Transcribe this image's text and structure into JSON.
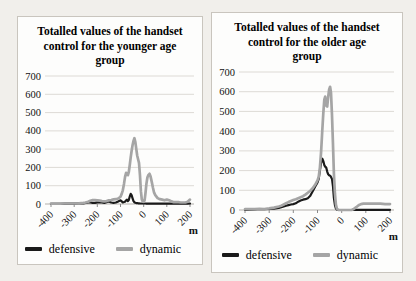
{
  "chart_data": [
    {
      "type": "line",
      "title": "Totalled values of the handset control for the younger age group",
      "xlabel": "m",
      "ylim": [
        0,
        700
      ],
      "yticks": [
        0,
        100,
        200,
        300,
        400,
        500,
        600,
        700
      ],
      "xticks": [
        -400,
        -300,
        -200,
        -100,
        0,
        100,
        200
      ],
      "grid": "horizontal",
      "legend_position": "bottom",
      "x": [
        -400,
        -380,
        -360,
        -340,
        -320,
        -300,
        -280,
        -260,
        -250,
        -240,
        -230,
        -220,
        -210,
        -200,
        -190,
        -180,
        -170,
        -160,
        -150,
        -140,
        -130,
        -120,
        -110,
        -100,
        -95,
        -90,
        -85,
        -80,
        -76,
        -72,
        -68,
        -64,
        -60,
        -56,
        -52,
        -48,
        -44,
        -40,
        -36,
        -32,
        -28,
        -24,
        -20,
        -16,
        -12,
        -8,
        -4,
        0,
        4,
        8,
        12,
        16,
        20,
        25,
        30,
        35,
        40,
        45,
        50,
        60,
        70,
        80,
        90,
        100,
        110,
        120,
        130,
        140,
        150,
        160,
        170,
        180,
        190,
        200
      ],
      "series": [
        {
          "name": "defensive",
          "color": "#1a1a1a",
          "values": [
            1,
            1,
            1,
            2,
            2,
            2,
            3,
            4,
            6,
            8,
            8,
            6,
            6,
            9,
            10,
            8,
            6,
            10,
            14,
            8,
            6,
            8,
            14,
            20,
            14,
            9,
            11,
            13,
            20,
            24,
            16,
            22,
            42,
            55,
            48,
            32,
            16,
            10,
            7,
            5,
            5,
            4,
            4,
            3,
            3,
            3,
            3,
            3,
            3,
            3,
            2,
            2,
            2,
            2,
            2,
            2,
            2,
            2,
            2,
            2,
            2,
            3,
            2,
            3,
            2,
            2,
            2,
            2,
            2,
            2,
            2,
            2,
            2,
            3
          ]
        },
        {
          "name": "dynamic",
          "color": "#a5a5a5",
          "values": [
            2,
            2,
            2,
            3,
            3,
            3,
            4,
            6,
            8,
            12,
            18,
            22,
            22,
            20,
            18,
            16,
            15,
            16,
            20,
            22,
            25,
            26,
            30,
            40,
            55,
            75,
            110,
            150,
            170,
            160,
            158,
            175,
            215,
            255,
            290,
            320,
            345,
            360,
            340,
            300,
            265,
            245,
            225,
            155,
            70,
            25,
            14,
            12,
            20,
            60,
            110,
            145,
            158,
            165,
            150,
            120,
            90,
            62,
            48,
            32,
            26,
            24,
            20,
            24,
            20,
            14,
            10,
            10,
            10,
            8,
            8,
            8,
            12,
            24
          ]
        }
      ]
    },
    {
      "type": "line",
      "title": "Totalled values of the handset control for the older age group",
      "xlabel": "m",
      "ylim": [
        0,
        700
      ],
      "yticks": [
        0,
        100,
        200,
        300,
        400,
        500,
        600,
        700
      ],
      "xticks": [
        -400,
        -300,
        -200,
        -100,
        0,
        100,
        200
      ],
      "grid": "horizontal",
      "legend_position": "bottom",
      "x": [
        -400,
        -380,
        -360,
        -340,
        -320,
        -300,
        -280,
        -260,
        -250,
        -240,
        -230,
        -220,
        -210,
        -200,
        -190,
        -180,
        -170,
        -160,
        -150,
        -140,
        -130,
        -120,
        -110,
        -100,
        -95,
        -90,
        -85,
        -80,
        -76,
        -72,
        -68,
        -64,
        -60,
        -56,
        -52,
        -48,
        -44,
        -40,
        -36,
        -32,
        -28,
        -24,
        -20,
        -16,
        -12,
        -8,
        -4,
        0,
        4,
        8,
        12,
        16,
        20,
        25,
        30,
        35,
        40,
        45,
        50,
        60,
        70,
        80,
        90,
        100,
        110,
        120,
        130,
        140,
        150,
        160,
        170,
        180,
        190,
        200
      ],
      "series": [
        {
          "name": "defensive",
          "color": "#1a1a1a",
          "values": [
            1,
            2,
            3,
            5,
            4,
            5,
            7,
            10,
            14,
            18,
            22,
            25,
            28,
            30,
            34,
            42,
            48,
            52,
            55,
            60,
            72,
            95,
            118,
            140,
            158,
            200,
            240,
            260,
            248,
            228,
            220,
            215,
            195,
            182,
            176,
            174,
            168,
            158,
            118,
            62,
            26,
            8,
            2,
            0,
            0,
            0,
            0,
            0,
            0,
            0,
            0,
            0,
            0,
            0,
            0,
            0,
            0,
            0,
            0,
            1,
            1,
            1,
            1,
            1,
            1,
            1,
            1,
            1,
            1,
            1,
            1,
            1,
            1,
            1
          ]
        },
        {
          "name": "dynamic",
          "color": "#a5a5a5",
          "values": [
            4,
            5,
            4,
            6,
            5,
            8,
            12,
            18,
            22,
            28,
            34,
            40,
            45,
            50,
            55,
            60,
            65,
            70,
            78,
            88,
            98,
            110,
            128,
            150,
            168,
            215,
            295,
            405,
            490,
            560,
            575,
            530,
            525,
            570,
            610,
            625,
            595,
            480,
            330,
            185,
            85,
            28,
            8,
            2,
            0,
            0,
            0,
            0,
            0,
            0,
            0,
            0,
            0,
            0,
            0,
            0,
            0,
            2,
            5,
            14,
            24,
            30,
            32,
            32,
            32,
            32,
            32,
            32,
            32,
            32,
            31,
            30,
            30,
            30
          ]
        }
      ]
    }
  ]
}
